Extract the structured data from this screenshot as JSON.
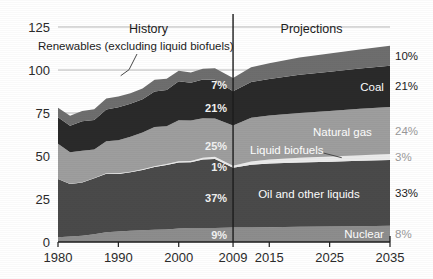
{
  "chart_data": {
    "type": "area",
    "stacked": true,
    "title": "",
    "subtitle": "",
    "xlabel": "",
    "ylabel": "",
    "xlim": [
      1980,
      2035
    ],
    "ylim": [
      0,
      125
    ],
    "yticks": [
      "0",
      "25",
      "50",
      "75",
      "100",
      "125"
    ],
    "ytick_values": [
      0,
      25,
      50,
      75,
      100,
      125
    ],
    "xticks": [
      "1980",
      "1990",
      "2000",
      "2009",
      "2015",
      "2025",
      "2035"
    ],
    "xtick_values": [
      1980,
      1990,
      2000,
      2009,
      2015,
      2025,
      2035
    ],
    "grid": "horizontal-light",
    "legend": "inline-annotations",
    "section_labels": [
      {
        "text": "History",
        "x": 1995
      },
      {
        "text": "Projections",
        "x": 2022
      }
    ],
    "divider_x": 2009,
    "annotations": [
      {
        "text": "Renewables (excluding liquid biofuels)",
        "x": 1992,
        "y": 112,
        "leader_to_x": 1999,
        "leader_to_y": 91
      }
    ],
    "x": [
      1980,
      1982,
      1984,
      1986,
      1988,
      1990,
      1992,
      1994,
      1996,
      1998,
      2000,
      2002,
      2004,
      2006,
      2009,
      2012,
      2015,
      2020,
      2025,
      2030,
      2035
    ],
    "series": [
      {
        "name": "Nuclear",
        "color": "#8d8d8d",
        "label_2009": "9%",
        "label_2035": "8%",
        "end_name": "Nuclear",
        "values": [
          2.7,
          3.2,
          3.6,
          4.5,
          5.7,
          6.1,
          6.5,
          6.8,
          7.1,
          7.2,
          7.9,
          8.1,
          8.2,
          8.2,
          8.4,
          8.5,
          8.6,
          8.8,
          9.0,
          9.2,
          9.4
        ]
      },
      {
        "name": "Oil and other liquids",
        "color": "#4a4a4a",
        "label_2009": "37%",
        "label_2035": "33%",
        "end_name": "Oil and other liquids",
        "values": [
          34.0,
          30.5,
          31.0,
          32.5,
          34.0,
          33.5,
          34.0,
          35.0,
          36.5,
          37.5,
          38.3,
          38.2,
          39.8,
          40.0,
          34.8,
          36.4,
          37.0,
          37.4,
          37.7,
          38.0,
          38.3
        ]
      },
      {
        "name": "Liquid biofuels",
        "color": "#ebebeb",
        "label_2009": "1%",
        "label_2035": "3%",
        "end_name": "Liquid biofuels",
        "values": [
          0.0,
          0.1,
          0.1,
          0.2,
          0.3,
          0.3,
          0.4,
          0.5,
          0.5,
          0.6,
          0.7,
          0.8,
          1.0,
          1.3,
          1.2,
          1.9,
          2.4,
          2.8,
          3.0,
          3.2,
          3.4
        ]
      },
      {
        "name": "Natural gas",
        "color": "#9e9e9e",
        "label_2009": "25%",
        "label_2035": "24%",
        "end_name": "Natural gas",
        "values": [
          20.4,
          18.4,
          18.4,
          16.6,
          18.6,
          19.3,
          20.3,
          21.3,
          22.7,
          22.0,
          23.9,
          23.6,
          23.0,
          22.3,
          23.4,
          25.4,
          25.5,
          26.0,
          26.5,
          27.0,
          27.4
        ]
      },
      {
        "name": "Coal",
        "color": "#2a2a2a",
        "label_2009": "21%",
        "label_2035": "21%",
        "end_name": "Coal",
        "values": [
          15.4,
          15.4,
          17.1,
          17.2,
          18.5,
          19.2,
          19.2,
          19.4,
          20.7,
          21.0,
          22.6,
          21.9,
          22.5,
          22.5,
          19.8,
          20.8,
          21.2,
          22.2,
          22.8,
          23.4,
          24.0
        ]
      },
      {
        "name": "Renewables (excluding liquid biofuels)",
        "color": "#6e6e6e",
        "label_2009": "7%",
        "label_2035": "10%",
        "end_name": "",
        "values": [
          5.5,
          5.8,
          6.0,
          6.2,
          6.3,
          6.2,
          6.1,
          6.3,
          6.9,
          6.6,
          6.2,
          6.0,
          6.2,
          6.7,
          7.8,
          8.6,
          9.2,
          10.0,
          10.6,
          11.1,
          11.6
        ]
      }
    ]
  },
  "axis": {
    "y_labels": [
      "125",
      "100",
      "75",
      "50",
      "25",
      "0"
    ],
    "x_labels": [
      "1980",
      "1990",
      "2000",
      "2009",
      "2015",
      "2025",
      "2035"
    ]
  },
  "labels_2009": [
    "7%",
    "21%",
    "25%",
    "1%",
    "37%",
    "9%"
  ],
  "labels_2035": [
    "10%",
    "21%",
    "24%",
    "3%",
    "33%",
    "8%"
  ],
  "names_right": [
    "Coal",
    "Natural gas",
    "Liquid biofuels",
    "Oil and other liquids",
    "Nuclear"
  ],
  "sections": {
    "history": "History",
    "projections": "Projections"
  },
  "annotation": {
    "renewables": "Renewables (excluding liquid biofuels)"
  },
  "colors": {
    "renewables": "#6e6e6e",
    "coal": "#2a2a2a",
    "natural_gas": "#9e9e9e",
    "liquid_biofuels": "#ebebeb",
    "oil": "#4a4a4a",
    "nuclear": "#8d8d8d",
    "background": "#ffffff",
    "axis": "#1c1c1c",
    "grid": "#b9b9b9"
  }
}
